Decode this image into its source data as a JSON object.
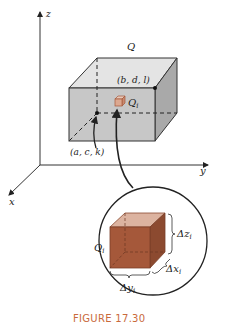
{
  "figure": {
    "caption": "FIGURE 17.30",
    "axes": {
      "x": "x",
      "y": "y",
      "z": "z"
    },
    "box_label": "Q",
    "corner_far": "(b, d, l)",
    "corner_near": "(a, c, k)",
    "subbox_label": "Q",
    "subbox_subscript": "i",
    "inset": {
      "label": "Q",
      "label_subscript": "i",
      "dz": "Δz",
      "dz_sub": "i",
      "dx": "Δx",
      "dx_sub": "i",
      "dy": "Δy",
      "dy_sub": "i"
    },
    "colors": {
      "box_front": "#c7c7c7",
      "box_top": "#e4e4e4",
      "box_side": "#a9a9a9",
      "subbox_front": "#a5583a",
      "subbox_top": "#dcb3a0",
      "subbox_side": "#8c4a30",
      "caption": "#c96a3c"
    }
  }
}
